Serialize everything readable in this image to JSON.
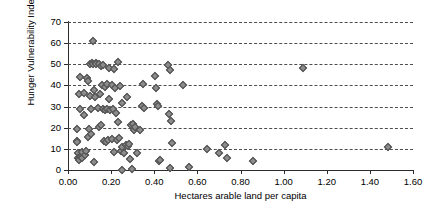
{
  "chart_data": {
    "type": "scatter",
    "title": "",
    "xlabel": "Hectares arable land per capita",
    "ylabel": "Hunger Vulnerability Index",
    "xlim": [
      0.0,
      1.6
    ],
    "ylim": [
      0,
      70
    ],
    "xticks": [
      "0.00",
      "0.20",
      "0.40",
      "0.60",
      "0.80",
      "1.00",
      "1.20",
      "1.40",
      "1.60"
    ],
    "xtick_values": [
      0.0,
      0.2,
      0.4,
      0.6,
      0.8,
      1.0,
      1.2,
      1.4,
      1.6
    ],
    "yticks": [
      "0",
      "10",
      "20",
      "30",
      "40",
      "50",
      "60",
      "70"
    ],
    "ytick_values": [
      0,
      10,
      20,
      30,
      40,
      50,
      60,
      70
    ],
    "grid": "horizontal-dashed",
    "legend": "none",
    "marker": "diamond",
    "marker_color": "#8c8c8c",
    "marker_edge_color": "#4a4a4a",
    "series": [
      {
        "name": "Countries",
        "points": [
          [
            0.04,
            19.5
          ],
          [
            0.04,
            14.0
          ],
          [
            0.04,
            13.5
          ],
          [
            0.045,
            8.0
          ],
          [
            0.045,
            6.0
          ],
          [
            0.05,
            5.5
          ],
          [
            0.05,
            5.0
          ],
          [
            0.05,
            36.0
          ],
          [
            0.055,
            44.0
          ],
          [
            0.055,
            29.0
          ],
          [
            0.06,
            7.0
          ],
          [
            0.06,
            6.5
          ],
          [
            0.065,
            6.0
          ],
          [
            0.065,
            8.5
          ],
          [
            0.07,
            26.0
          ],
          [
            0.07,
            36.5
          ],
          [
            0.075,
            7.5
          ],
          [
            0.08,
            9.0
          ],
          [
            0.085,
            43.5
          ],
          [
            0.09,
            42.5
          ],
          [
            0.09,
            16.0
          ],
          [
            0.095,
            19.5
          ],
          [
            0.1,
            50.5
          ],
          [
            0.1,
            35.0
          ],
          [
            0.105,
            17.0
          ],
          [
            0.105,
            29.0
          ],
          [
            0.11,
            51.0
          ],
          [
            0.115,
            61.0
          ],
          [
            0.115,
            50.5
          ],
          [
            0.12,
            4.0
          ],
          [
            0.12,
            38.0
          ],
          [
            0.125,
            34.5
          ],
          [
            0.13,
            51.0
          ],
          [
            0.13,
            50.5
          ],
          [
            0.135,
            29.5
          ],
          [
            0.14,
            50.5
          ],
          [
            0.14,
            20.5
          ],
          [
            0.145,
            36.0
          ],
          [
            0.15,
            49.5
          ],
          [
            0.15,
            21.5
          ],
          [
            0.155,
            40.5
          ],
          [
            0.16,
            50.0
          ],
          [
            0.16,
            29.0
          ],
          [
            0.165,
            14.0
          ],
          [
            0.17,
            39.5
          ],
          [
            0.17,
            28.5
          ],
          [
            0.175,
            13.5
          ],
          [
            0.18,
            41.0
          ],
          [
            0.18,
            29.0
          ],
          [
            0.185,
            14.5
          ],
          [
            0.19,
            48.5
          ],
          [
            0.19,
            34.0
          ],
          [
            0.195,
            28.5
          ],
          [
            0.2,
            40.5
          ],
          [
            0.2,
            15.0
          ],
          [
            0.205,
            29.0
          ],
          [
            0.21,
            48.0
          ],
          [
            0.21,
            8.5
          ],
          [
            0.215,
            39.0
          ],
          [
            0.22,
            27.0
          ],
          [
            0.225,
            14.5
          ],
          [
            0.23,
            51.5
          ],
          [
            0.23,
            23.0
          ],
          [
            0.235,
            15.5
          ],
          [
            0.24,
            40.0
          ],
          [
            0.245,
            9.0
          ],
          [
            0.25,
            0.0
          ],
          [
            0.25,
            32.0
          ],
          [
            0.25,
            11.0
          ],
          [
            0.26,
            8.0
          ],
          [
            0.265,
            12.0
          ],
          [
            0.27,
            34.5
          ],
          [
            0.275,
            11.5
          ],
          [
            0.28,
            12.5
          ],
          [
            0.285,
            5.5
          ],
          [
            0.29,
            21.5
          ],
          [
            0.295,
            0.5
          ],
          [
            0.3,
            22.0
          ],
          [
            0.305,
            19.0
          ],
          [
            0.31,
            20.5
          ],
          [
            0.32,
            8.0
          ],
          [
            0.33,
            19.0
          ],
          [
            0.34,
            30.5
          ],
          [
            0.345,
            41.0
          ],
          [
            0.35,
            29.5
          ],
          [
            0.4,
            44.5
          ],
          [
            0.405,
            39.0
          ],
          [
            0.41,
            31.5
          ],
          [
            0.415,
            30.5
          ],
          [
            0.42,
            4.5
          ],
          [
            0.425,
            5.0
          ],
          [
            0.46,
            50.0
          ],
          [
            0.465,
            26.5
          ],
          [
            0.47,
            47.5
          ],
          [
            0.47,
            1.0
          ],
          [
            0.475,
            23.5
          ],
          [
            0.48,
            13.0
          ],
          [
            0.53,
            40.5
          ],
          [
            0.56,
            1.5
          ],
          [
            0.645,
            10.0
          ],
          [
            0.7,
            8.0
          ],
          [
            0.725,
            12.0
          ],
          [
            0.735,
            6.0
          ],
          [
            0.855,
            4.5
          ],
          [
            1.09,
            48.5
          ],
          [
            1.48,
            11.0
          ]
        ]
      }
    ]
  }
}
